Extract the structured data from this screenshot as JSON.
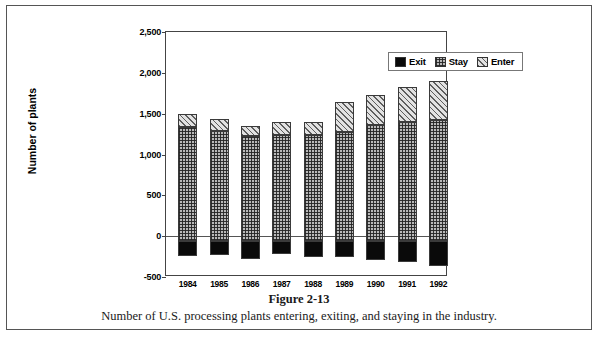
{
  "figure": {
    "number_label": "Figure 2-13",
    "caption": "Number of U.S. processing plants entering, exiting, and staying in the industry."
  },
  "chart_data": {
    "type": "bar",
    "stacked": true,
    "title": "",
    "xlabel": "",
    "ylabel": "Number of plants",
    "ylim": [
      -500,
      2500
    ],
    "ytick_values": [
      -500,
      0,
      500,
      1000,
      1500,
      2000,
      2500
    ],
    "ytick_labels": [
      "-500",
      "0",
      "500",
      "1,000",
      "1,500",
      "2,000",
      "2,500"
    ],
    "grid": false,
    "legend_position": "top-right-inside",
    "categories": [
      "1984",
      "1985",
      "1986",
      "1987",
      "1988",
      "1989",
      "1990",
      "1991",
      "1992"
    ],
    "series": [
      {
        "name": "Exit",
        "key": "exit",
        "values": [
          -180,
          -170,
          -215,
          -160,
          -195,
          -190,
          -235,
          -250,
          -310
        ]
      },
      {
        "name": "Stay",
        "key": "stay",
        "values": [
          1400,
          1345,
          1290,
          1300,
          1300,
          1340,
          1420,
          1465,
          1480
        ]
      },
      {
        "name": "Enter",
        "key": "enter",
        "values": [
          155,
          150,
          120,
          155,
          165,
          370,
          375,
          425,
          480
        ]
      }
    ],
    "totals_positive": [
      1555,
      1495,
      1410,
      1455,
      1465,
      1710,
      1795,
      1890,
      1960
    ]
  },
  "legend": {
    "items": [
      {
        "label": "Exit",
        "pattern": "solid-black"
      },
      {
        "label": "Stay",
        "pattern": "cross-hatch"
      },
      {
        "label": "Enter",
        "pattern": "diagonal-hatch"
      }
    ]
  },
  "colors": {
    "exit": "#0a0a0a",
    "stay": "#b9b9b9",
    "enter": "#e2e2e2",
    "axis": "#444444",
    "frame": "#555555"
  }
}
